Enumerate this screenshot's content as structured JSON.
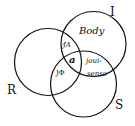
{
  "diagram": {
    "type": "three-circle-venn",
    "circles": [
      {
        "id": "I",
        "label": "I",
        "cx": 93.5,
        "cy": 44,
        "r": 32.5
      },
      {
        "id": "R",
        "label": "R",
        "cx": 48,
        "cy": 62,
        "r": 33.5
      },
      {
        "id": "S",
        "label": "S",
        "cx": 83.5,
        "cy": 84,
        "r": 33
      }
    ],
    "regions": {
      "body": "Body",
      "j_barred_a": "J̸A",
      "a": "a",
      "j_phi": "JΦ",
      "jouissance_line1": "joui-",
      "jouissance_line2": "sense"
    },
    "stroke_color": "#111111",
    "background": "#ffffff"
  }
}
